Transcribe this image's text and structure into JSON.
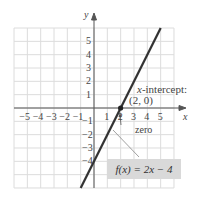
{
  "chart_data": {
    "type": "line",
    "title": "",
    "xlabel": "x",
    "ylabel": "y",
    "xlim": [
      -6,
      6
    ],
    "ylim": [
      -6,
      6
    ],
    "grid": true,
    "x_ticks": [
      "-5",
      "-4",
      "-3",
      "-2",
      "-1",
      "1",
      "2",
      "3",
      "4",
      "5"
    ],
    "y_ticks": [
      "5",
      "4",
      "3",
      "2",
      "1",
      "-1",
      "-2",
      "-3",
      "-4"
    ],
    "series": [
      {
        "name": "f(x) = 2x - 4",
        "x": [
          -1,
          0,
          2,
          5
        ],
        "y": [
          -6,
          -4,
          0,
          6
        ],
        "color": "#333333"
      }
    ],
    "points": [
      {
        "x": 2,
        "y": 0,
        "label": "(2, 0)"
      }
    ],
    "annotations": {
      "intercept_label": "x-intercept:",
      "intercept_point": "(2, 0)",
      "zero_label": "zero",
      "equation": "f(x) = 2x − 4"
    }
  },
  "axes": {
    "x_label": "x",
    "y_label": "y"
  },
  "colors": {
    "line": "#333333",
    "grid": "#d8d8d8",
    "axis": "#444444",
    "eq_box": "#d9d9d9"
  }
}
